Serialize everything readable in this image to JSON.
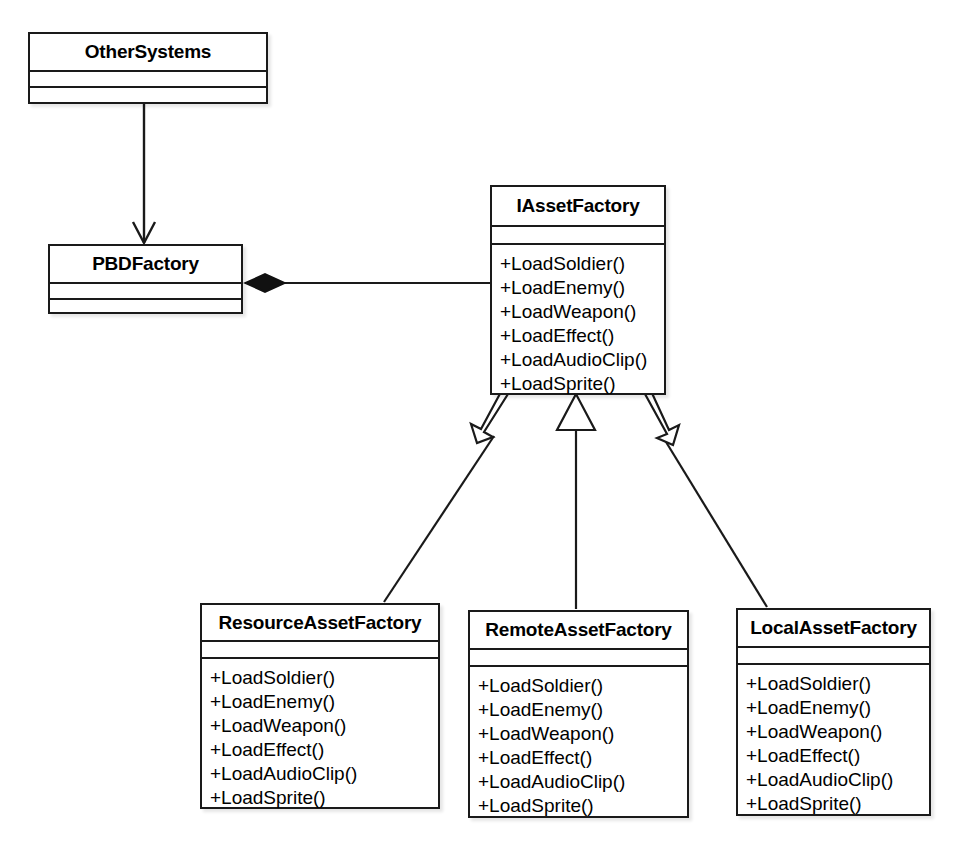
{
  "diagram": {
    "type": "uml-class-diagram",
    "background_color": "#ffffff",
    "line_color": "#1a1a1a"
  },
  "classes": {
    "othersystems": {
      "name": "OtherSystems",
      "attributes": [],
      "methods": []
    },
    "pbdfactory": {
      "name": "PBDFactory",
      "attributes": [],
      "methods": []
    },
    "iassetfactory": {
      "name": "IAssetFactory",
      "attributes": [],
      "methods": [
        "+LoadSoldier()",
        "+LoadEnemy()",
        "+LoadWeapon()",
        "+LoadEffect()",
        "+LoadAudioClip()",
        "+LoadSprite()"
      ]
    },
    "resourceassetfactory": {
      "name": "ResourceAssetFactory",
      "attributes": [],
      "methods": [
        "+LoadSoldier()",
        "+LoadEnemy()",
        "+LoadWeapon()",
        "+LoadEffect()",
        "+LoadAudioClip()",
        "+LoadSprite()"
      ]
    },
    "remoteassetfactory": {
      "name": "RemoteAssetFactory",
      "attributes": [],
      "methods": [
        "+LoadSoldier()",
        "+LoadEnemy()",
        "+LoadWeapon()",
        "+LoadEffect()",
        "+LoadAudioClip()",
        "+LoadSprite()"
      ]
    },
    "localassetfactory": {
      "name": "LocalAssetFactory",
      "attributes": [],
      "methods": [
        "+LoadSoldier()",
        "+LoadEnemy()",
        "+LoadWeapon()",
        "+LoadEffect()",
        "+LoadAudioClip()",
        "+LoadSprite()"
      ]
    }
  },
  "relationships": [
    {
      "id": "othersystems-to-pbdfactory",
      "kind": "dependency-arrow",
      "from": "othersystems",
      "to": "pbdfactory",
      "arrowhead": "open-arrow"
    },
    {
      "id": "pbdfactory-composes-iassetfactory",
      "kind": "composition",
      "from": "pbdfactory",
      "to": "iassetfactory",
      "arrowhead": "filled-diamond"
    },
    {
      "id": "resourceassetfactory-realizes-iassetfactory",
      "kind": "generalization",
      "from": "resourceassetfactory",
      "to": "iassetfactory",
      "arrowhead": "hollow-triangle"
    },
    {
      "id": "remoteassetfactory-realizes-iassetfactory",
      "kind": "generalization",
      "from": "remoteassetfactory",
      "to": "iassetfactory",
      "arrowhead": "hollow-triangle"
    },
    {
      "id": "localassetfactory-realizes-iassetfactory",
      "kind": "generalization",
      "from": "localassetfactory",
      "to": "iassetfactory",
      "arrowhead": "hollow-triangle"
    }
  ]
}
